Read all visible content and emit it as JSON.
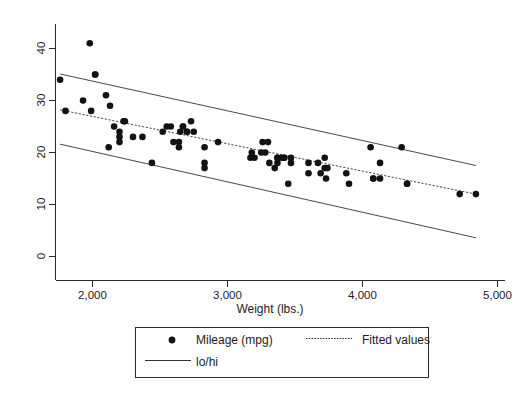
{
  "chart_data": {
    "type": "scatter",
    "title": "",
    "xlabel": "Weight (lbs.)",
    "ylabel": "",
    "xlim": [
      1700,
      5000
    ],
    "ylim": [
      0,
      43
    ],
    "xticks": [
      2000,
      3000,
      4000,
      5000
    ],
    "xtick_labels": [
      "2,000",
      "3,000",
      "4,000",
      "5,000"
    ],
    "yticks": [
      0,
      10,
      20,
      30,
      40
    ],
    "ytick_labels": [
      "0",
      "10",
      "20",
      "30",
      "40"
    ],
    "grid": false,
    "legend_position": "below-center",
    "series": [
      {
        "name": "Mileage (mpg)",
        "type": "scatter",
        "marker": "filled-circle",
        "color": "#121212",
        "x": [
          2930,
          3350,
          2640,
          3250,
          4080,
          3670,
          2230,
          3280,
          3880,
          3400,
          4330,
          3900,
          4290,
          4330,
          3720,
          3370,
          3470,
          2830,
          2200,
          2520,
          3310,
          3370,
          2730,
          3200,
          3470,
          4130,
          4060,
          4130,
          4080,
          3720,
          3370,
          2830,
          2200,
          2120,
          2020,
          2580,
          2830,
          2100,
          2550,
          2440,
          2300,
          2750,
          2160,
          1800,
          1760,
          2670,
          2370,
          2130,
          1980,
          2670,
          2700,
          2600,
          2650,
          2700,
          2640,
          2240,
          2200,
          2020,
          1930,
          1990,
          3170,
          3690,
          3180,
          3420,
          3300,
          3260,
          3420,
          3600,
          3740,
          3730,
          4720,
          4840,
          3600,
          3450
        ],
        "y": [
          22,
          17,
          22,
          20,
          15,
          18,
          26,
          20,
          16,
          19,
          14,
          14,
          21,
          14,
          19,
          18,
          19,
          21,
          22,
          24,
          18,
          19,
          26,
          19,
          18,
          18,
          21,
          15,
          15,
          17,
          19,
          17,
          23,
          21,
          35,
          25,
          18,
          31,
          25,
          18,
          23,
          24,
          25,
          28,
          34,
          25,
          23,
          29,
          41,
          25,
          24,
          22,
          24,
          24,
          21,
          26,
          24,
          35,
          30,
          28,
          19,
          16,
          20,
          19,
          22,
          22,
          19,
          16,
          17,
          15,
          12,
          12,
          18,
          14
        ]
      },
      {
        "name": "Fitted values",
        "type": "line",
        "style": "dotted",
        "color": "#333333",
        "x": [
          1760,
          4840
        ],
        "y": [
          28.2,
          12.0
        ]
      },
      {
        "name": "lo/hi",
        "type": "line-pair",
        "style": "solid",
        "color": "#333333",
        "upper": {
          "x": [
            1760,
            4840
          ],
          "y": [
            35.1,
            17.5
          ]
        },
        "lower": {
          "x": [
            1760,
            4840
          ],
          "y": [
            21.6,
            3.6
          ]
        }
      }
    ],
    "legend_entries": [
      {
        "label": "Mileage (mpg)",
        "symbol": "filled-circle"
      },
      {
        "label": "Fitted values",
        "symbol": "dotted-line"
      },
      {
        "label": "lo/hi",
        "symbol": "solid-line"
      }
    ]
  },
  "axes": {
    "x_title": "Weight (lbs.)",
    "x_tick_labels": [
      "2,000",
      "3,000",
      "4,000",
      "5,000"
    ],
    "y_tick_labels": [
      "0",
      "10",
      "20",
      "30",
      "40"
    ]
  },
  "legend": {
    "mileage_label": "Mileage (mpg)",
    "fitted_label": "Fitted values",
    "lohi_label": "lo/hi"
  }
}
